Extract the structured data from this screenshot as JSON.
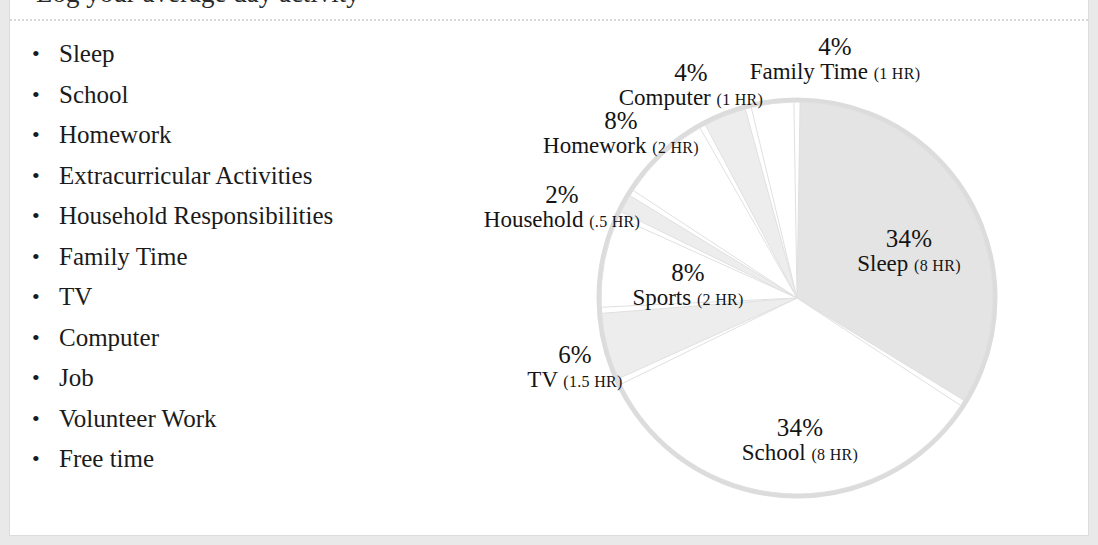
{
  "page": {
    "heading_clipped": "Log your average day activity",
    "background": "#ffffff",
    "frame_color": "#e9e9e9",
    "divider_color": "#d7d7d7"
  },
  "bullet_list": {
    "bullet_glyph": "•",
    "items": [
      "Sleep",
      "School",
      "Homework",
      "Extracurricular Activities",
      "Household Responsibilities",
      "Family Time",
      "TV",
      "Computer",
      "Job",
      "Volunteer Work",
      "Free time"
    ]
  },
  "chart_data": {
    "type": "pie",
    "title": "",
    "total_hours": 24,
    "legend_position": "labels-on-slices",
    "start_angle_deg": 0,
    "direction": "clockwise",
    "center": {
      "x": 237,
      "y": 278
    },
    "radius": 200,
    "outline_color": "#dcdcdc",
    "gap_color": "#ffffff",
    "slices": [
      {
        "name": "Sleep",
        "percent": 34,
        "hours": "8 HR",
        "pct_label": "34%",
        "fill": "#e4e4e4"
      },
      {
        "name": "School",
        "percent": 34,
        "hours": "8 HR",
        "pct_label": "34%",
        "fill": "#ffffff"
      },
      {
        "name": "TV",
        "percent": 6,
        "hours": "1.5 HR",
        "pct_label": "6%",
        "fill": "#ededed"
      },
      {
        "name": "Sports",
        "percent": 8,
        "hours": "2 HR",
        "pct_label": "8%",
        "fill": "#ffffff"
      },
      {
        "name": "Household",
        "percent": 2,
        "hours": ".5 HR",
        "pct_label": "2%",
        "fill": "#ededed"
      },
      {
        "name": "Homework",
        "percent": 8,
        "hours": "2 HR",
        "pct_label": "8%",
        "fill": "#ffffff"
      },
      {
        "name": "Computer",
        "percent": 4,
        "hours": "1 HR",
        "pct_label": "4%",
        "fill": "#ededed"
      },
      {
        "name": "Family Time",
        "percent": 4,
        "hours": "1 HR",
        "pct_label": "4%",
        "fill": "#ffffff"
      }
    ],
    "labels": {
      "sleep": {
        "pct": "34%",
        "name": "Sleep",
        "hr": "(8 HR)"
      },
      "school": {
        "pct": "34%",
        "name": "School",
        "hr": "(8 HR)"
      },
      "tv": {
        "pct": "6%",
        "name": "TV",
        "hr": "(1.5 HR)"
      },
      "sports": {
        "pct": "8%",
        "name": "Sports",
        "hr": "(2 HR)"
      },
      "household": {
        "pct": "2%",
        "name": "Household",
        "hr": "(.5 HR)"
      },
      "homework": {
        "pct": "8%",
        "name": "Homework",
        "hr": "(2 HR)"
      },
      "computer": {
        "pct": "4%",
        "name": "Computer",
        "hr": "(1 HR)"
      },
      "family_time": {
        "pct": "4%",
        "name": "Family Time",
        "hr": "(1 HR)"
      }
    }
  }
}
